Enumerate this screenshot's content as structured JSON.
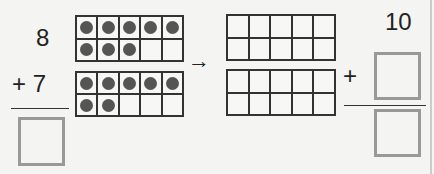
{
  "problem": {
    "addend1": "8",
    "addend2_label": "+ 7",
    "plus_sign": "+",
    "ten_label": "10",
    "arrow": "→"
  },
  "frames": {
    "left_top": {
      "filled": 8,
      "total": 10
    },
    "left_bottom": {
      "filled": 7,
      "total": 10
    },
    "right_top": {
      "filled": 0,
      "total": 10
    },
    "right_bottom": {
      "filled": 0,
      "total": 10
    }
  },
  "answer_boxes": {
    "left_sum": "",
    "right_addend": "",
    "right_sum": ""
  },
  "colors": {
    "dot": "#555555",
    "box_border": "#999999",
    "grid": "#333333"
  }
}
